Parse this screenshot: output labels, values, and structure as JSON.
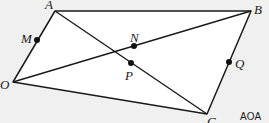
{
  "diagram": {
    "type": "geometry-figure",
    "colors": {
      "background": "#f0f0f0",
      "fill": "#ffffff",
      "stroke": "#1a1a1a"
    },
    "vertices": [
      {
        "id": "A",
        "label": "A",
        "x": 55,
        "y": 11
      },
      {
        "id": "B",
        "label": "B",
        "x": 251,
        "y": 11
      },
      {
        "id": "C",
        "label": "C",
        "x": 207,
        "y": 114
      },
      {
        "id": "O",
        "label": "O",
        "x": 13,
        "y": 82
      }
    ],
    "points": [
      {
        "id": "M",
        "label": "M",
        "x": 37,
        "y": 40,
        "on": "OA"
      },
      {
        "id": "N",
        "label": "N",
        "x": 134,
        "y": 45,
        "on": "OB"
      },
      {
        "id": "P",
        "label": "P",
        "x": 131,
        "y": 63,
        "on": "AC"
      },
      {
        "id": "Q",
        "label": "Q",
        "x": 229,
        "y": 63,
        "on": "BC"
      }
    ],
    "segments": [
      "OA",
      "AB",
      "BC",
      "CO",
      "AC",
      "OB"
    ],
    "credit": "AOA"
  }
}
